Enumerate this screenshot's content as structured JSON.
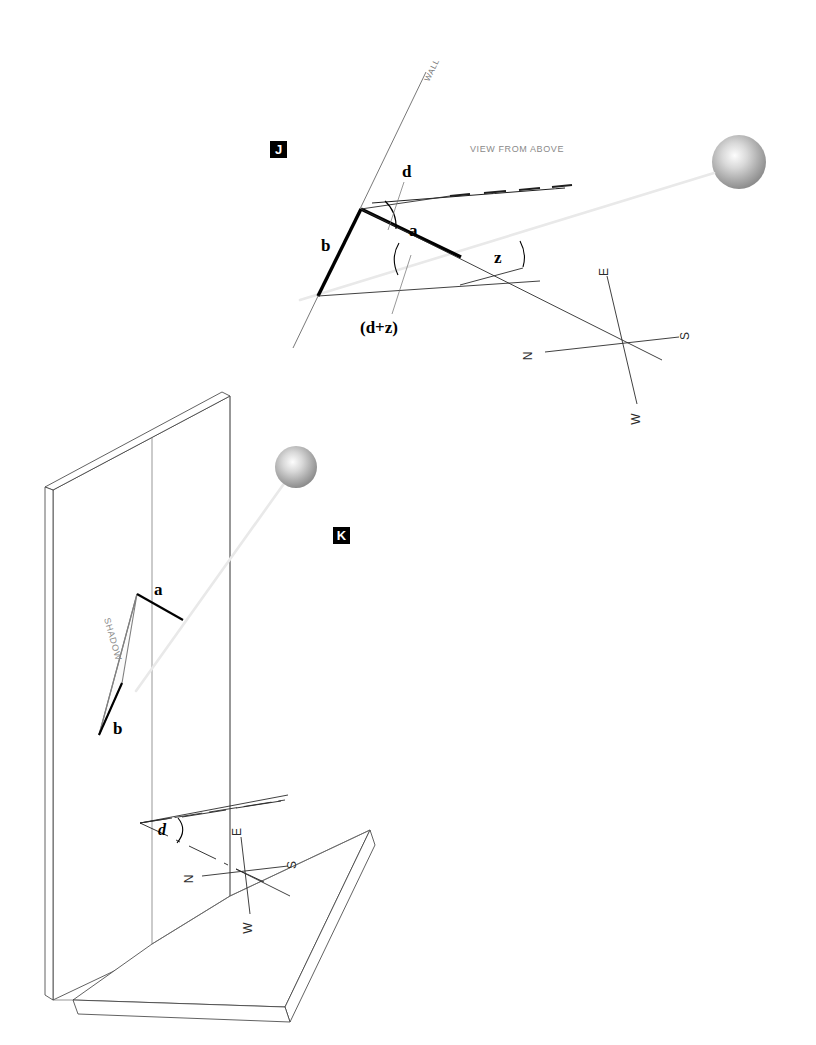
{
  "figure": {
    "background_color": "#ffffff",
    "width": 816,
    "height": 1045
  },
  "panels": [
    {
      "id": "J",
      "tag": "J",
      "tag_background": "#000000",
      "tag_color": "#ffffff",
      "caption": "VIEW FROM ABOVE",
      "caption_color": "#8a8a8a",
      "wall_label": "WALL",
      "labels": {
        "side_b": "b",
        "side_a": "a",
        "angle_d": "d",
        "angle_z": "z",
        "angle_dz": "(d+z)"
      },
      "compass": {
        "north": "N",
        "east": "E",
        "south": "S",
        "west": "W"
      },
      "sun": {
        "name": "sun-sphere",
        "fill_center": "#fdfdfd",
        "fill_edge": "#8d8d8d"
      }
    },
    {
      "id": "K",
      "tag": "K",
      "tag_background": "#000000",
      "tag_color": "#ffffff",
      "shadow_label": "SHADOW",
      "shadow_color": "#808080",
      "labels": {
        "gnomon_a": "a",
        "gnomon_b": "b",
        "angle_d": "d"
      },
      "compass": {
        "north": "N",
        "east": "E",
        "south": "S",
        "west": "W"
      },
      "sun": {
        "name": "sun-sphere",
        "fill_center": "#fdfdfd",
        "fill_edge": "#8d8d8d"
      }
    }
  ]
}
